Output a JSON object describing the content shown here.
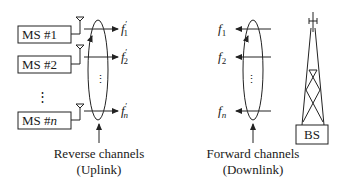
{
  "diagram": {
    "type": "cellular-channel-diagram",
    "mobile_stations": [
      {
        "label_prefix": "MS #",
        "index": "1"
      },
      {
        "label_prefix": "MS #",
        "index": "2"
      },
      {
        "label_prefix": "MS #",
        "index": "n"
      }
    ],
    "vertical_ellipsis": "⋮",
    "reverse_channels": {
      "frequencies": [
        {
          "base": "f",
          "sub": "1",
          "prime": "′"
        },
        {
          "base": "f",
          "sub": "2",
          "prime": "′"
        },
        {
          "base": "f",
          "sub": "n",
          "prime": "′"
        }
      ],
      "caption_line1": "Reverse channels",
      "caption_line2": "(Uplink)"
    },
    "forward_channels": {
      "frequencies": [
        {
          "base": "f",
          "sub": "1"
        },
        {
          "base": "f",
          "sub": "2"
        },
        {
          "base": "f",
          "sub": "n"
        }
      ],
      "caption_line1": "Forward channels",
      "caption_line2": "(Downlink)"
    },
    "base_station": {
      "label": "BS"
    },
    "colors": {
      "ink": "#222222",
      "background": "#ffffff"
    }
  }
}
